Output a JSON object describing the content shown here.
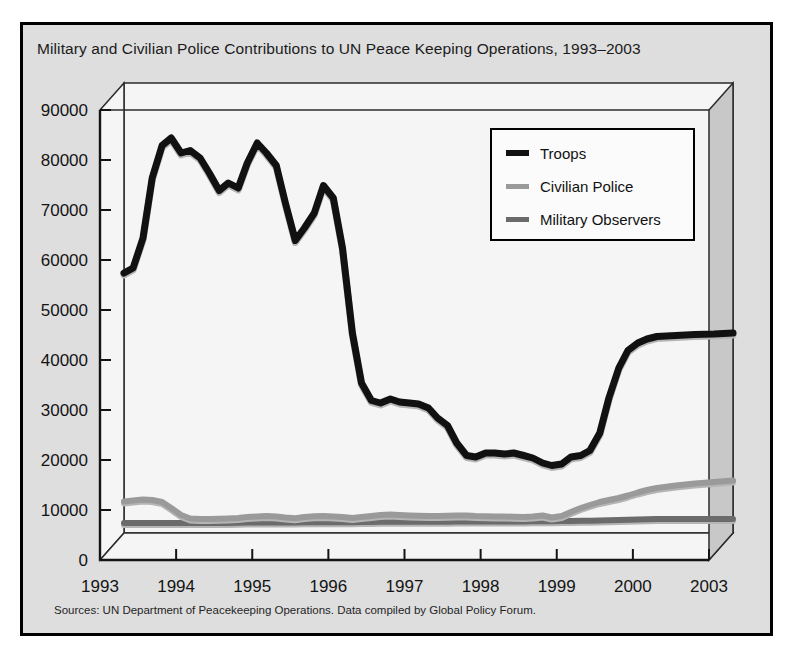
{
  "figure": {
    "title": "Military and Civilian Police Contributions to UN Peace Keeping Operations, 1993–2003",
    "source": "Sources: UN Department of Peacekeeping Operations. Data compiled by Global Policy Forum.",
    "frame_background": "#dedede",
    "plot_background": "#f5f5f5",
    "wall_color": "#c8c8c8"
  },
  "legend": {
    "position": "top-right-inside",
    "entries": [
      {
        "label": "Troops",
        "color": "#111111",
        "thickness": 7
      },
      {
        "label": "Civilian Police",
        "color": "#9a9a9a",
        "thickness": 6
      },
      {
        "label": "Military Observers",
        "color": "#6b6b6b",
        "thickness": 6
      }
    ]
  },
  "chart_data": {
    "type": "line",
    "title": "Military and Civilian Police Contributions to UN Peace Keeping Operations, 1993–2003",
    "xlabel": "",
    "ylabel": "",
    "ylim": [
      0,
      90000
    ],
    "ytick_labels": [
      "0",
      "10000",
      "20000",
      "30000",
      "40000",
      "50000",
      "60000",
      "70000",
      "80000",
      "90000"
    ],
    "yticks": [
      0,
      10000,
      20000,
      30000,
      40000,
      50000,
      60000,
      70000,
      80000,
      90000
    ],
    "xtick_labels": [
      "1993",
      "1994",
      "1995",
      "1996",
      "1997",
      "1998",
      "1999",
      "2000",
      "2003"
    ],
    "xticks": [
      0,
      1,
      2,
      3,
      4,
      5,
      6,
      7,
      8
    ],
    "grid": false,
    "x": [
      0,
      0.12,
      0.25,
      0.37,
      0.5,
      0.62,
      0.75,
      0.87,
      1.0,
      1.12,
      1.25,
      1.37,
      1.5,
      1.62,
      1.75,
      1.87,
      2.0,
      2.12,
      2.25,
      2.37,
      2.5,
      2.62,
      2.75,
      2.87,
      3.0,
      3.12,
      3.25,
      3.37,
      3.5,
      3.62,
      3.75,
      3.87,
      4.0,
      4.12,
      4.25,
      4.37,
      4.5,
      4.62,
      4.75,
      4.87,
      5.0,
      5.12,
      5.25,
      5.37,
      5.5,
      5.62,
      5.75,
      5.87,
      6.0,
      6.12,
      6.25,
      6.37,
      6.5,
      6.62,
      6.75,
      6.87,
      7.0,
      7.25,
      7.5,
      7.75,
      8.0
    ],
    "series": [
      {
        "name": "Troops",
        "color": "#111111",
        "values": [
          52000,
          53000,
          59000,
          71000,
          77500,
          79000,
          76000,
          76500,
          75000,
          72000,
          68500,
          70000,
          69000,
          74000,
          78000,
          76000,
          73500,
          66000,
          58500,
          61000,
          64000,
          69500,
          67000,
          57000,
          40000,
          30000,
          26500,
          26000,
          26800,
          26200,
          26000,
          25800,
          25000,
          23000,
          21500,
          18000,
          15500,
          15200,
          16000,
          16000,
          15800,
          16000,
          15500,
          15000,
          14000,
          13500,
          13800,
          15200,
          15500,
          16500,
          20000,
          27000,
          33000,
          36500,
          38000,
          38800,
          39300,
          39500,
          39700,
          39800,
          40000
        ]
      },
      {
        "name": "Civilian Police",
        "color": "#9a9a9a",
        "values": [
          6300,
          6500,
          6700,
          6600,
          6200,
          5000,
          3600,
          2900,
          2800,
          2800,
          2850,
          2900,
          3000,
          3200,
          3300,
          3400,
          3300,
          3100,
          2950,
          3200,
          3350,
          3400,
          3300,
          3200,
          3000,
          3200,
          3400,
          3600,
          3700,
          3600,
          3500,
          3450,
          3400,
          3400,
          3450,
          3500,
          3500,
          3400,
          3350,
          3300,
          3300,
          3250,
          3200,
          3300,
          3500,
          3100,
          3400,
          4200,
          5000,
          5600,
          6200,
          6600,
          7000,
          7500,
          8100,
          8600,
          9000,
          9500,
          9900,
          10200,
          10500
        ]
      },
      {
        "name": "Military Observers",
        "color": "#6b6b6b",
        "values": [
          2000,
          2000,
          2000,
          2000,
          2000,
          2000,
          2000,
          2000,
          2000,
          2000,
          2000,
          2000,
          2050,
          2100,
          2100,
          2100,
          2100,
          2100,
          2100,
          2150,
          2150,
          2150,
          2150,
          2150,
          2150,
          2200,
          2200,
          2250,
          2250,
          2250,
          2250,
          2250,
          2250,
          2250,
          2250,
          2300,
          2300,
          2300,
          2300,
          2300,
          2300,
          2300,
          2300,
          2350,
          2350,
          2350,
          2400,
          2400,
          2450,
          2450,
          2500,
          2550,
          2600,
          2650,
          2700,
          2750,
          2800,
          2800,
          2800,
          2800,
          2800
        ]
      }
    ]
  }
}
